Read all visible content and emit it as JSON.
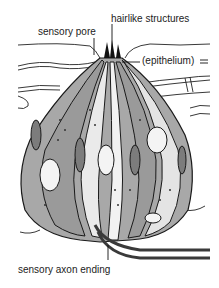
{
  "diagram": {
    "labels": {
      "sensory_pore": "sensory pore",
      "hairlike_structures": "hairlike structures",
      "epithelium": "(epithelium)",
      "sensory_axon_ending": "sensory axon ending"
    },
    "colors": {
      "cell_fill": "#9a9a9a",
      "cell_light": "#e8e8e8",
      "outline": "#1a1a1a",
      "background": "#ffffff"
    }
  }
}
